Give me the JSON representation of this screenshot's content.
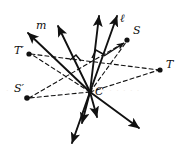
{
  "figure": {
    "type": "geometry-diagram",
    "background_color": "#ffffff",
    "stroke_color": "#111111",
    "center": {
      "name": "C",
      "x": 90,
      "y": 92
    },
    "labels": [
      {
        "id": "m",
        "text": "m",
        "x": 36,
        "y": 20
      },
      {
        "id": "l",
        "text": "ℓ",
        "x": 120,
        "y": 13
      },
      {
        "id": "S",
        "text": "S",
        "x": 133,
        "y": 25
      },
      {
        "id": "T",
        "text": "T",
        "x": 166,
        "y": 59
      },
      {
        "id": "Tp",
        "text": "T′",
        "x": 14,
        "y": 45
      },
      {
        "id": "Sp",
        "text": "S′",
        "x": 14,
        "y": 83
      },
      {
        "id": "C",
        "text": "C",
        "x": 95,
        "y": 86
      }
    ],
    "points": [
      {
        "id": "S",
        "x": 127,
        "y": 40
      },
      {
        "id": "T",
        "x": 160,
        "y": 70
      },
      {
        "id": "Tp",
        "x": 29,
        "y": 54
      },
      {
        "id": "Sp",
        "x": 26,
        "y": 98
      }
    ],
    "solid_rays": [
      {
        "id": "ray-m-up",
        "x2": 28,
        "y2": 32
      },
      {
        "id": "ray-up-left",
        "x2": 57,
        "y2": 24
      },
      {
        "id": "ray-up-center",
        "x2": 99,
        "y2": 14
      },
      {
        "id": "ray-l-up",
        "x2": 117,
        "y2": 14
      },
      {
        "id": "ray-down-left",
        "x2": 72,
        "y2": 145
      },
      {
        "id": "ray-down-a",
        "x2": 82,
        "y2": 124
      },
      {
        "id": "ray-down-b",
        "x2": 96,
        "y2": 118
      },
      {
        "id": "ray-down-right",
        "x2": 140,
        "y2": 129
      }
    ],
    "dashed_segments": [
      {
        "id": "dash-C-S",
        "x2": 127,
        "y2": 40
      },
      {
        "id": "dash-C-T",
        "x2": 160,
        "y2": 70
      },
      {
        "id": "dash-C-Tp",
        "x2": 29,
        "y2": 54
      },
      {
        "id": "dash-C-Sp",
        "x2": 26,
        "y2": 98
      },
      {
        "id": "dash-S-Tp",
        "x2": 0,
        "y2": 0
      }
    ],
    "right_angle_marks": [
      {
        "id": "mark-left",
        "x": 76,
        "y": 57
      },
      {
        "id": "mark-right",
        "x": 97,
        "y": 53
      }
    ],
    "watermark_text": "· · · · · · · · · · · · · · · · · · · ·"
  }
}
